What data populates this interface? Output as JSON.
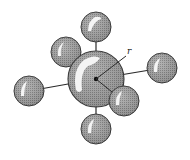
{
  "diagram": {
    "type": "molecular-geometry",
    "label_radius": "r",
    "colors": {
      "sphere_fill": "#9a9a9a",
      "sphere_dark": "#6e6e6e",
      "highlight": "#f4f4f4",
      "outline": "#3a3a3a",
      "bond": "#2a2a2a",
      "background": "#ffffff"
    },
    "central_atom": {
      "cx": 96,
      "cy": 79,
      "r": 28
    },
    "ligands": [
      {
        "name": "top",
        "cx": 96,
        "cy": 27,
        "r": 15
      },
      {
        "name": "upper-left",
        "cx": 66,
        "cy": 52,
        "r": 15
      },
      {
        "name": "left",
        "cx": 29,
        "cy": 91,
        "r": 15
      },
      {
        "name": "right",
        "cx": 162,
        "cy": 68,
        "r": 15
      },
      {
        "name": "lower-right",
        "cx": 124,
        "cy": 101,
        "r": 15
      },
      {
        "name": "bottom",
        "cx": 96,
        "cy": 129,
        "r": 15
      }
    ]
  }
}
